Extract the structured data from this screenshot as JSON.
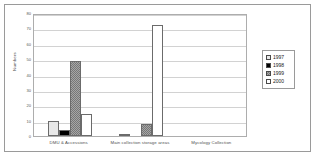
{
  "chart_data": {
    "type": "bar",
    "title": "",
    "xlabel": "",
    "ylabel": "Numbers",
    "ylim": [
      0,
      80
    ],
    "yticks": [
      "0",
      "10",
      "20",
      "30",
      "40",
      "50",
      "60",
      "70",
      "80"
    ],
    "grid": true,
    "legend_position": "right",
    "categories": [
      "DMU & Accessions",
      "Main collection storage areas",
      "Mycology Collection"
    ],
    "series": [
      {
        "name": "1997",
        "color": "#e8e8e8",
        "values": [
          10,
          1,
          0
        ]
      },
      {
        "name": "1998",
        "color": "#000000",
        "values": [
          4,
          0,
          0
        ]
      },
      {
        "name": "1999",
        "color": "#a6a6a6",
        "values": [
          49,
          8,
          0
        ]
      },
      {
        "name": "2000",
        "color": "#ffffff",
        "values": [
          14,
          72,
          0
        ]
      }
    ]
  },
  "legend": {
    "items": [
      {
        "label": "1997"
      },
      {
        "label": "1998"
      },
      {
        "label": "1999"
      },
      {
        "label": "2000"
      }
    ]
  }
}
